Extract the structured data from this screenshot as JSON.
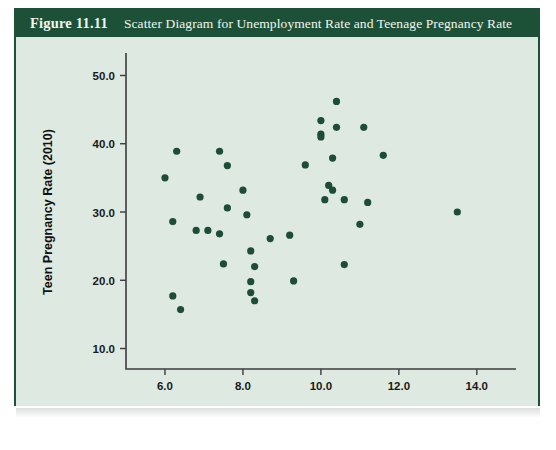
{
  "figure": {
    "number": "Figure 11.11",
    "caption": "Scatter Diagram for Unemployment Rate and Teenage Pregnancy Rate",
    "header_color": "#1c5137",
    "panel_color": "#dde9e1",
    "marker_color": "#1e4d36"
  },
  "chart_data": {
    "type": "scatter",
    "title": "Scatter Diagram for Unemployment Rate and Teenage Pregnancy Rate",
    "xlabel": "Unemployment Rate (2009)",
    "ylabel": "Teen Pregnancy Rate (2010)",
    "xlim": [
      5.0,
      14.8
    ],
    "ylim": [
      7.0,
      53.0
    ],
    "xticks": [
      6.0,
      8.0,
      10.0,
      12.0,
      14.0
    ],
    "xtick_labels": [
      "6.0",
      "8.0",
      "10.0",
      "12.0",
      "14.0"
    ],
    "yticks": [
      10.0,
      20.0,
      30.0,
      40.0,
      50.0
    ],
    "ytick_labels": [
      "10.0",
      "20.0",
      "30.0",
      "40.0",
      "50.0"
    ],
    "grid": false,
    "legend": false,
    "marker": "circle",
    "points": [
      {
        "x": 6.3,
        "y": 38.9
      },
      {
        "x": 6.0,
        "y": 35.0
      },
      {
        "x": 6.2,
        "y": 28.6
      },
      {
        "x": 6.2,
        "y": 17.7
      },
      {
        "x": 6.4,
        "y": 15.7
      },
      {
        "x": 6.9,
        "y": 32.2
      },
      {
        "x": 6.8,
        "y": 27.3
      },
      {
        "x": 7.1,
        "y": 27.3
      },
      {
        "x": 7.4,
        "y": 38.9
      },
      {
        "x": 7.6,
        "y": 36.8
      },
      {
        "x": 7.6,
        "y": 30.6
      },
      {
        "x": 7.4,
        "y": 26.8
      },
      {
        "x": 7.5,
        "y": 22.4
      },
      {
        "x": 8.0,
        "y": 33.2
      },
      {
        "x": 8.1,
        "y": 29.6
      },
      {
        "x": 8.2,
        "y": 24.3
      },
      {
        "x": 8.3,
        "y": 22.0
      },
      {
        "x": 8.2,
        "y": 19.8
      },
      {
        "x": 8.2,
        "y": 18.2
      },
      {
        "x": 8.3,
        "y": 17.0
      },
      {
        "x": 8.7,
        "y": 26.1
      },
      {
        "x": 9.2,
        "y": 26.6
      },
      {
        "x": 9.3,
        "y": 19.9
      },
      {
        "x": 9.6,
        "y": 36.9
      },
      {
        "x": 10.0,
        "y": 43.4
      },
      {
        "x": 10.0,
        "y": 41.4
      },
      {
        "x": 10.0,
        "y": 41.0
      },
      {
        "x": 10.2,
        "y": 33.9
      },
      {
        "x": 10.1,
        "y": 31.8
      },
      {
        "x": 10.4,
        "y": 46.2
      },
      {
        "x": 10.4,
        "y": 42.4
      },
      {
        "x": 10.3,
        "y": 37.9
      },
      {
        "x": 10.3,
        "y": 33.2
      },
      {
        "x": 10.6,
        "y": 31.8
      },
      {
        "x": 10.6,
        "y": 22.3
      },
      {
        "x": 11.1,
        "y": 42.4
      },
      {
        "x": 11.2,
        "y": 31.4
      },
      {
        "x": 11.0,
        "y": 28.2
      },
      {
        "x": 11.6,
        "y": 38.3
      },
      {
        "x": 13.5,
        "y": 30.0
      }
    ]
  }
}
